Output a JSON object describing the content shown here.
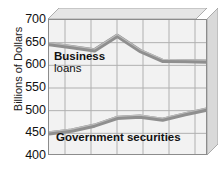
{
  "chart_data": {
    "type": "line",
    "title": "",
    "subtitle": "",
    "xlabel": "",
    "ylabel": "Billions of Dollars",
    "ylim": [
      400,
      700
    ],
    "yticks": [
      700,
      650,
      600,
      550,
      500,
      450,
      400
    ],
    "ytick_labels": [
      "700",
      "650",
      "600",
      "550",
      "500",
      "450",
      "400"
    ],
    "xticks": [],
    "xtick_labels": [],
    "grid": true,
    "grid_columns": 7,
    "legend": "inline-labels",
    "legend_position": "inside-plot",
    "x": [
      0,
      1,
      2,
      3,
      4,
      5,
      6,
      7
    ],
    "series": [
      {
        "name": "Business loans",
        "label_line1": "Business",
        "label_line2": "loans",
        "color": "#8c8c8c",
        "values": [
          647,
          640,
          633,
          665,
          632,
          610,
          609,
          608
        ]
      },
      {
        "name": "Government securities",
        "label_line1": "Government securities",
        "label_line2": "",
        "color": "#8c8c8c",
        "values": [
          450,
          456,
          467,
          484,
          487,
          480,
          492,
          503
        ]
      }
    ]
  },
  "axis": {
    "y_title": "Billions of Dollars",
    "ticks": [
      "700",
      "650",
      "600",
      "550",
      "500",
      "450",
      "400"
    ]
  },
  "labels": {
    "business_loans_line1": "Business",
    "business_loans_line2": "loans",
    "government_securities": "Government securities"
  },
  "colors": {
    "plot_background": "#f2f2f2",
    "plot_border": "#8c8c8c",
    "grid_line": "#b8b8b8",
    "series_line": "#8c8c8c",
    "series_line_dark": "#6f6f6f",
    "bevel_top": "#e3e3e3",
    "bevel_right": "#d2d2d2",
    "text": "#111111"
  }
}
